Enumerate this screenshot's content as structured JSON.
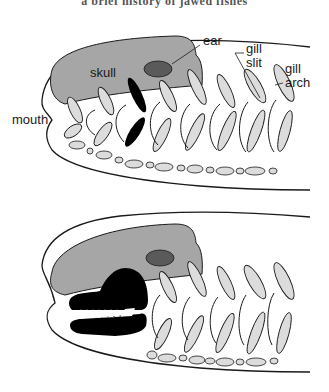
{
  "title": "a brief history of jawed fishes",
  "colors": {
    "skull": "#a6a6a6",
    "ear": "#5a5a5a",
    "gill_arch": "#dcdcdc",
    "jaw": "#000000",
    "outline": "#1a1a1a",
    "background": "#ffffff"
  },
  "panels": [
    {
      "name": "jawless-ancestor",
      "labels": {
        "skull": "skull",
        "ear": "ear",
        "gill_slit": "gill slit",
        "gill_slit_line1": "gill",
        "gill_slit_line2": "slit",
        "gill_arch_line1": "gill",
        "gill_arch_line2": "arch",
        "mouth": "mouth"
      },
      "highlighted_arch": "first gill arch (black)"
    },
    {
      "name": "jawed-fish",
      "labels": {},
      "highlighted_structure": "jaws with teeth (black), derived from gill arch"
    }
  ]
}
